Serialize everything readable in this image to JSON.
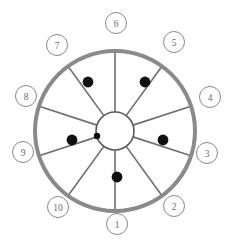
{
  "diagram": {
    "name": "numbered-wheel-diagram",
    "type": "wheel",
    "center": {
      "x": 115,
      "y": 131
    },
    "outer_ring": {
      "radius": 80,
      "stroke_width": 4,
      "color": "#8a8a8a"
    },
    "hub": {
      "radius": 19,
      "stroke_width": 1.6,
      "color": "#5a5a5a",
      "fill": "#ffffff"
    },
    "spoke": {
      "color": "#6e6e6e",
      "stroke_width": 1.6
    },
    "label_circle": {
      "radius": 10.5,
      "stroke_width": 1,
      "color": "#8a8a8a",
      "fill": "#ffffff",
      "font_size": 9.5,
      "text_color": "#6b6b6b"
    },
    "dot": {
      "color": "#101010",
      "radius": 5.4,
      "small_radius": 3.2
    },
    "labels": [
      {
        "id": "label-1",
        "text": "1",
        "angle_deg": 90,
        "x": 117,
        "y": 224
      },
      {
        "id": "label-2",
        "text": "2",
        "angle_deg": 54,
        "x": 174,
        "y": 206
      },
      {
        "id": "label-3",
        "text": "3",
        "angle_deg": 18,
        "x": 207,
        "y": 153
      },
      {
        "id": "label-4",
        "text": "4",
        "angle_deg": 342,
        "x": 210,
        "y": 97
      },
      {
        "id": "label-5",
        "text": "5",
        "angle_deg": 306,
        "x": 174,
        "y": 42
      },
      {
        "id": "label-6",
        "text": "6",
        "angle_deg": 270,
        "x": 116,
        "y": 23
      },
      {
        "id": "label-7",
        "text": "7",
        "angle_deg": 234,
        "x": 57,
        "y": 45
      },
      {
        "id": "label-8",
        "text": "8",
        "angle_deg": 198,
        "x": 26,
        "y": 96
      },
      {
        "id": "label-9",
        "text": "9",
        "angle_deg": 162,
        "x": 23,
        "y": 152
      },
      {
        "id": "label-10",
        "text": "10",
        "angle_deg": 126,
        "x": 58,
        "y": 207
      }
    ],
    "spokes": [
      {
        "id": "spoke-1",
        "angle_deg": 90
      },
      {
        "id": "spoke-2",
        "angle_deg": 54
      },
      {
        "id": "spoke-3",
        "angle_deg": 18
      },
      {
        "id": "spoke-4",
        "angle_deg": 342
      },
      {
        "id": "spoke-5",
        "angle_deg": 306
      },
      {
        "id": "spoke-6",
        "angle_deg": 270
      },
      {
        "id": "spoke-7",
        "angle_deg": 234
      },
      {
        "id": "spoke-8",
        "angle_deg": 198
      },
      {
        "id": "spoke-9",
        "angle_deg": 162
      },
      {
        "id": "spoke-10",
        "angle_deg": 126
      }
    ],
    "dots": [
      {
        "id": "dot-on-spoke-7",
        "x": 88,
        "y": 82,
        "size": "large"
      },
      {
        "id": "dot-on-spoke-5",
        "x": 145,
        "y": 82,
        "size": "large"
      },
      {
        "id": "dot-on-spoke-9",
        "x": 72,
        "y": 140,
        "size": "large"
      },
      {
        "id": "dot-on-spoke-3",
        "x": 163,
        "y": 140,
        "size": "large"
      },
      {
        "id": "dot-on-spoke-1",
        "x": 117,
        "y": 177,
        "size": "large"
      },
      {
        "id": "dot-at-hub",
        "x": 97,
        "y": 136,
        "size": "small"
      }
    ]
  }
}
